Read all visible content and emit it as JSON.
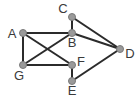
{
  "diagram": {
    "type": "undirected-graph",
    "colors": {
      "edge": "#2b2b2b",
      "node": "#9a9a9a",
      "label": "#3a3a3a"
    },
    "nodes": [
      {
        "id": "A",
        "label": "A"
      },
      {
        "id": "B",
        "label": "B"
      },
      {
        "id": "C",
        "label": "C"
      },
      {
        "id": "D",
        "label": "D"
      },
      {
        "id": "E",
        "label": "E"
      },
      {
        "id": "F",
        "label": "F"
      },
      {
        "id": "G",
        "label": "G"
      }
    ],
    "edges": [
      [
        "A",
        "B"
      ],
      [
        "A",
        "G"
      ],
      [
        "A",
        "F"
      ],
      [
        "G",
        "B"
      ],
      [
        "G",
        "F"
      ],
      [
        "C",
        "B"
      ],
      [
        "C",
        "D"
      ],
      [
        "B",
        "D"
      ],
      [
        "F",
        "E"
      ],
      [
        "E",
        "D"
      ]
    ]
  }
}
